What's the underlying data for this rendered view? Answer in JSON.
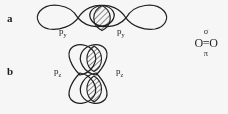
{
  "figure": {
    "panels": [
      {
        "letter": "a",
        "bond_type": "sigma",
        "description": "end-on (head-on) overlap of two p orbitals forming a sigma bond",
        "left_orbital_label": "p",
        "left_orbital_subscript": "y",
        "right_orbital_label": "p",
        "right_orbital_subscript": "y",
        "overlap_regions": 1,
        "overlap_fill": "diagonal-hatch"
      },
      {
        "letter": "b",
        "bond_type": "pi",
        "description": "side-by-side (lateral) overlap of two p orbitals forming a pi bond",
        "left_orbital_label": "p",
        "left_orbital_subscript": "z",
        "right_orbital_label": "p",
        "right_orbital_subscript": "z",
        "overlap_regions": 2,
        "overlap_fill": "diagonal-hatch"
      }
    ],
    "formula": {
      "top_symbol": "σ",
      "core": "O=O",
      "bottom_symbol": "π"
    },
    "colors": {
      "stroke": "#1a1a1a",
      "background": "#ffffff",
      "hatch": "#1a1a1a"
    }
  }
}
